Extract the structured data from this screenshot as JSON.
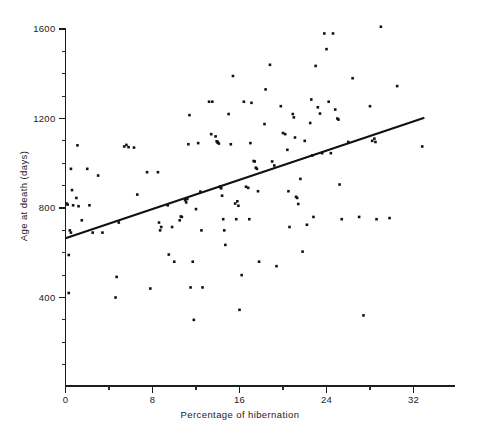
{
  "chart_data": {
    "type": "scatter",
    "title": "",
    "xlabel": "Percentage of hibernation",
    "ylabel": "Age at death (days)",
    "xlim": [
      -0.7,
      36.0
    ],
    "ylim": [
      0,
      1640
    ],
    "grid": false,
    "legend": "none",
    "x_ticks": [
      0,
      8,
      16,
      24,
      32
    ],
    "x_tick_labels": [
      "0",
      "8",
      "16",
      "24",
      "32"
    ],
    "x_minor_ticks": [
      4,
      12,
      20,
      28
    ],
    "y_ticks": [
      400,
      800,
      1200,
      1600
    ],
    "y_tick_labels": [
      "400",
      "800",
      "1200",
      "1600"
    ],
    "y_minor_ticks": [
      100,
      200,
      300,
      500,
      600,
      700,
      900,
      1000,
      1100,
      1300,
      1400,
      1500
    ],
    "marker": "square",
    "marker_color": "#121212",
    "marker_size_px": 2.6,
    "fit_line": {
      "label": "linear regression",
      "color": "#111111",
      "x_start": 0.0,
      "y_start": 665,
      "x_end": 33.0,
      "y_end": 1203
    },
    "points": [
      [
        0.1,
        820
      ],
      [
        0.2,
        815
      ],
      [
        0.3,
        420
      ],
      [
        0.3,
        590
      ],
      [
        0.4,
        700
      ],
      [
        0.5,
        690
      ],
      [
        0.5,
        975
      ],
      [
        0.6,
        880
      ],
      [
        0.7,
        812
      ],
      [
        1.0,
        845
      ],
      [
        1.1,
        1080
      ],
      [
        1.2,
        808
      ],
      [
        1.5,
        745
      ],
      [
        2.0,
        975
      ],
      [
        2.2,
        812
      ],
      [
        2.5,
        690
      ],
      [
        3.0,
        945
      ],
      [
        3.4,
        690
      ],
      [
        4.6,
        400
      ],
      [
        4.7,
        492
      ],
      [
        4.9,
        735
      ],
      [
        5.4,
        1075
      ],
      [
        5.6,
        1082
      ],
      [
        5.8,
        1072
      ],
      [
        6.3,
        1070
      ],
      [
        6.6,
        860
      ],
      [
        7.5,
        960
      ],
      [
        7.8,
        440
      ],
      [
        8.5,
        960
      ],
      [
        8.6,
        735
      ],
      [
        8.7,
        700
      ],
      [
        8.8,
        715
      ],
      [
        9.4,
        812
      ],
      [
        9.5,
        592
      ],
      [
        9.8,
        715
      ],
      [
        10.0,
        560
      ],
      [
        10.5,
        745
      ],
      [
        10.6,
        762
      ],
      [
        10.7,
        760
      ],
      [
        11.0,
        835
      ],
      [
        11.1,
        825
      ],
      [
        11.2,
        840
      ],
      [
        11.3,
        1085
      ],
      [
        11.4,
        1215
      ],
      [
        11.5,
        445
      ],
      [
        11.7,
        560
      ],
      [
        11.8,
        300
      ],
      [
        12.0,
        795
      ],
      [
        12.2,
        1090
      ],
      [
        12.4,
        873
      ],
      [
        12.5,
        700
      ],
      [
        12.6,
        445
      ],
      [
        13.2,
        1275
      ],
      [
        13.4,
        1130
      ],
      [
        13.5,
        1275
      ],
      [
        13.8,
        1120
      ],
      [
        13.9,
        1098
      ],
      [
        14.0,
        1095
      ],
      [
        14.0,
        1092
      ],
      [
        14.1,
        1088
      ],
      [
        14.2,
        895
      ],
      [
        14.3,
        892
      ],
      [
        14.3,
        888
      ],
      [
        14.4,
        855
      ],
      [
        14.5,
        750
      ],
      [
        14.6,
        700
      ],
      [
        14.7,
        635
      ],
      [
        15.0,
        1220
      ],
      [
        15.2,
        1085
      ],
      [
        15.4,
        1390
      ],
      [
        15.6,
        820
      ],
      [
        15.7,
        750
      ],
      [
        15.8,
        830
      ],
      [
        15.9,
        810
      ],
      [
        16.0,
        345
      ],
      [
        16.2,
        500
      ],
      [
        16.4,
        1275
      ],
      [
        16.6,
        895
      ],
      [
        16.8,
        890
      ],
      [
        16.9,
        750
      ],
      [
        17.0,
        1090
      ],
      [
        17.1,
        1270
      ],
      [
        17.3,
        1010
      ],
      [
        17.4,
        1008
      ],
      [
        17.5,
        980
      ],
      [
        17.6,
        975
      ],
      [
        17.7,
        875
      ],
      [
        17.8,
        560
      ],
      [
        18.3,
        1175
      ],
      [
        18.4,
        1330
      ],
      [
        18.8,
        1440
      ],
      [
        19.0,
        1008
      ],
      [
        19.2,
        990
      ],
      [
        19.4,
        540
      ],
      [
        19.8,
        1255
      ],
      [
        20.0,
        1135
      ],
      [
        20.2,
        1130
      ],
      [
        20.4,
        1060
      ],
      [
        20.5,
        875
      ],
      [
        20.6,
        715
      ],
      [
        20.9,
        1220
      ],
      [
        21.0,
        1205
      ],
      [
        21.1,
        1115
      ],
      [
        21.2,
        850
      ],
      [
        21.3,
        845
      ],
      [
        21.4,
        818
      ],
      [
        21.6,
        930
      ],
      [
        21.8,
        605
      ],
      [
        22.0,
        1100
      ],
      [
        22.2,
        725
      ],
      [
        22.5,
        1180
      ],
      [
        22.6,
        1285
      ],
      [
        22.7,
        1035
      ],
      [
        22.8,
        760
      ],
      [
        23.0,
        1435
      ],
      [
        23.2,
        1250
      ],
      [
        23.4,
        1222
      ],
      [
        23.6,
        1045
      ],
      [
        23.8,
        1580
      ],
      [
        24.0,
        1510
      ],
      [
        24.2,
        1275
      ],
      [
        24.4,
        1045
      ],
      [
        24.6,
        1580
      ],
      [
        24.8,
        1240
      ],
      [
        25.0,
        1200
      ],
      [
        25.1,
        1195
      ],
      [
        25.2,
        905
      ],
      [
        25.4,
        750
      ],
      [
        26.0,
        1095
      ],
      [
        26.4,
        1380
      ],
      [
        27.0,
        760
      ],
      [
        27.4,
        320
      ],
      [
        28.0,
        1255
      ],
      [
        28.2,
        1100
      ],
      [
        28.4,
        1110
      ],
      [
        28.5,
        1095
      ],
      [
        28.6,
        750
      ],
      [
        29.0,
        1610
      ],
      [
        29.8,
        755
      ],
      [
        30.5,
        1345
      ],
      [
        32.8,
        1075
      ]
    ]
  }
}
